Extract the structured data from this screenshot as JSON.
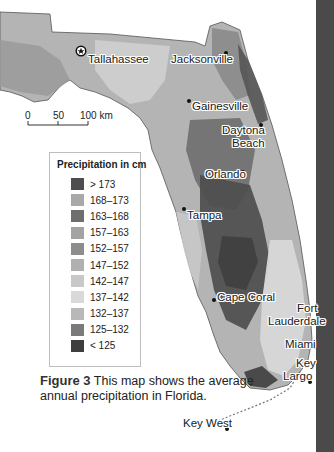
{
  "map": {
    "title": "Average annual precipitation in Florida",
    "cities": [
      {
        "name": "Tallahassee",
        "marker": "capital-star"
      },
      {
        "name": "Jacksonville",
        "marker": "dot"
      },
      {
        "name": "Gainesville",
        "marker": "dot"
      },
      {
        "name": "Daytona Beach",
        "marker": "dot"
      },
      {
        "name": "Orlando",
        "marker": "dot"
      },
      {
        "name": "Tampa",
        "marker": "dot"
      },
      {
        "name": "Cape Coral",
        "marker": "dot"
      },
      {
        "name": "Fort Lauderdale",
        "marker": "dot"
      },
      {
        "name": "Miami",
        "marker": "dot"
      },
      {
        "name": "Key Largo",
        "marker": "dot"
      },
      {
        "name": "Key West",
        "marker": "dot"
      }
    ],
    "labels": {
      "tallahassee": "Tallahassee",
      "jacksonville": "Jacksonville",
      "gainesville": "Gainesville",
      "daytona_1": "Daytona",
      "daytona_2": "Beach",
      "orlando": "Orlando",
      "tampa": "Tampa",
      "cape_coral": "Cape Coral",
      "fort_1": "Fort",
      "fort_2": "Lauderdale",
      "miami": "Miami",
      "key_largo_1": "Key",
      "key_largo_2": "Largo",
      "key_west": "Key West"
    },
    "scale_bar": {
      "ticks": [
        "0",
        "50",
        "100 km"
      ]
    }
  },
  "legend": {
    "title": "Precipitation in cm",
    "items": [
      {
        "label": "> 173",
        "color": "#4e4e4e"
      },
      {
        "label": "168–173",
        "color": "#a9a9a9"
      },
      {
        "label": "163–168",
        "color": "#6e6e6e"
      },
      {
        "label": "157–163",
        "color": "#a3a3a3"
      },
      {
        "label": "152–157",
        "color": "#8d8d8d"
      },
      {
        "label": "147–152",
        "color": "#b0b0b0"
      },
      {
        "label": "142–147",
        "color": "#c8c8c8"
      },
      {
        "label": "137–142",
        "color": "#d9d9d9"
      },
      {
        "label": "132–137",
        "color": "#b8b8b8"
      },
      {
        "label": "125–132",
        "color": "#7a7a7a"
      },
      {
        "label": "< 125",
        "color": "#3e3e3e"
      }
    ]
  },
  "caption": {
    "figure": "Figure 3",
    "text": "This map shows the average annual precipitation in Florida."
  }
}
